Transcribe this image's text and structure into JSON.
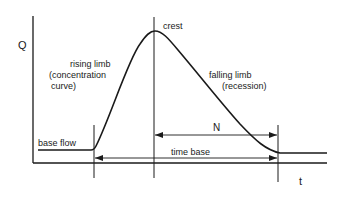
{
  "diagram": {
    "type": "hydrograph",
    "axes": {
      "y_label": "Q",
      "x_label": "t"
    },
    "labels": {
      "crest": "crest",
      "rising_limb_line1": "rising limb",
      "rising_limb_line2": "(concentration",
      "rising_limb_line3": "curve)",
      "falling_limb_line1": "falling limb",
      "falling_limb_line2": "(recession)",
      "base_flow": "base flow",
      "N": "N",
      "time_base": "time base"
    },
    "colors": {
      "line": "#1a1a1a",
      "background": "#ffffff"
    }
  }
}
